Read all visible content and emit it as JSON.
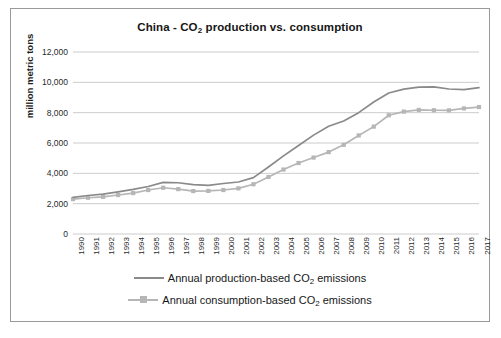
{
  "chart_data": {
    "type": "line",
    "title": "China - CO2 production vs. consumption",
    "title_prefix": "China - CO",
    "title_sub": "2",
    "title_suffix": " production vs. consumption",
    "xlabel": "",
    "ylabel": "million metric tons",
    "ylim": [
      0,
      12000
    ],
    "yticks": [
      "0",
      "2,000",
      "4,000",
      "6,000",
      "8,000",
      "10,000",
      "12,000"
    ],
    "ytick_values": [
      0,
      2000,
      4000,
      6000,
      8000,
      10000,
      12000
    ],
    "grid": true,
    "legend_position": "bottom",
    "categories": [
      "1990",
      "1991",
      "1992",
      "1993",
      "1994",
      "1995",
      "1996",
      "1997",
      "1998",
      "1999",
      "2000",
      "2001",
      "2002",
      "2003",
      "2004",
      "2005",
      "2006",
      "2007",
      "2008",
      "2009",
      "2010",
      "2011",
      "2012",
      "2013",
      "2014",
      "2015",
      "2016",
      "2017"
    ],
    "x": [
      1990,
      1991,
      1992,
      1993,
      1994,
      1995,
      1996,
      1997,
      1998,
      1999,
      2000,
      2001,
      2002,
      2003,
      2004,
      2005,
      2006,
      2007,
      2008,
      2009,
      2010,
      2011,
      2012,
      2013,
      2014,
      2015,
      2016,
      2017
    ],
    "series": [
      {
        "name": "Annual production-based CO2 emissions",
        "label_prefix": "Annual production-based CO",
        "label_sub": "2",
        "label_suffix": " emissions",
        "color": "#8a8a8a",
        "marker": "none",
        "values": [
          2420,
          2540,
          2630,
          2780,
          2940,
          3130,
          3400,
          3380,
          3250,
          3210,
          3330,
          3430,
          3720,
          4420,
          5150,
          5840,
          6520,
          7100,
          7450,
          8000,
          8700,
          9300,
          9550,
          9680,
          9700,
          9560,
          9520,
          9650
        ]
      },
      {
        "name": "Annual consumption-based CO2 emissions",
        "label_prefix": "Annual consumption-based CO",
        "label_sub": "2",
        "label_suffix": " emissions",
        "color": "#b6b6b6",
        "marker": "square",
        "values": [
          2300,
          2390,
          2450,
          2570,
          2700,
          2900,
          3050,
          2960,
          2830,
          2840,
          2900,
          3010,
          3280,
          3760,
          4250,
          4680,
          5040,
          5400,
          5880,
          6500,
          7080,
          7830,
          8070,
          8180,
          8160,
          8150,
          8280,
          8370
        ]
      }
    ]
  },
  "figure": {
    "border_color": "#9a9a9a",
    "background": "#ffffff",
    "gridline_color": "#cccccc"
  }
}
